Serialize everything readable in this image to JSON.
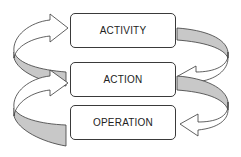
{
  "diagram": {
    "type": "cycle-levels",
    "levels": [
      {
        "id": "activity",
        "label": "ACTIVITY"
      },
      {
        "id": "action",
        "label": "ACTION"
      },
      {
        "id": "operation",
        "label": "OPERATION"
      }
    ],
    "arrows": [
      {
        "side": "left",
        "from": "action",
        "to": "activity",
        "direction": "up"
      },
      {
        "side": "left",
        "from": "operation",
        "to": "action",
        "direction": "up"
      },
      {
        "side": "right",
        "from": "activity",
        "to": "action",
        "direction": "down"
      },
      {
        "side": "right",
        "from": "action",
        "to": "operation",
        "direction": "down"
      }
    ],
    "colors": {
      "outline": "#3a3a3a",
      "ribbon_back": "#c8c8c8",
      "ribbon_front": "#ffffff",
      "box_fill": "#ffffff"
    }
  }
}
